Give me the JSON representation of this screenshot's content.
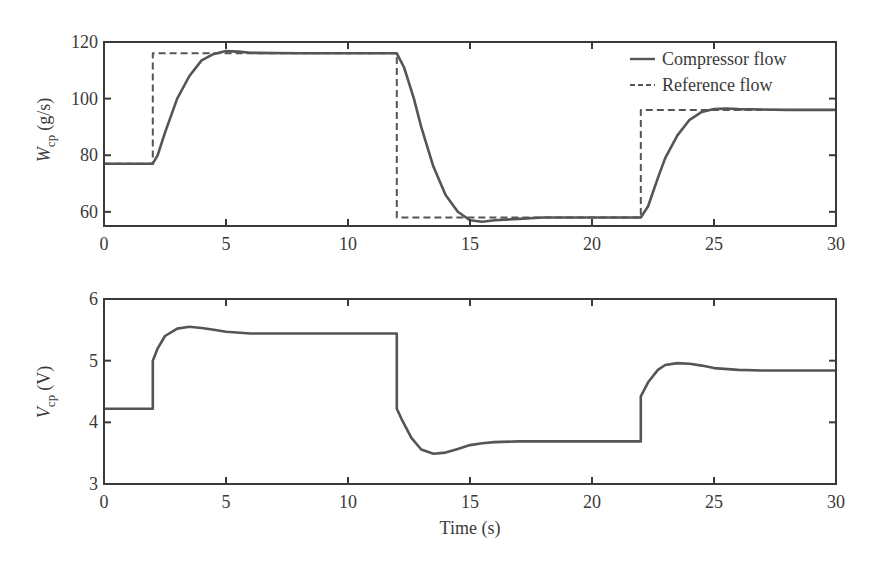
{
  "chart_data": [
    {
      "type": "line",
      "title": "",
      "xlabel": "",
      "ylabel": "W_cp (g/s)",
      "ylabel_main": "W",
      "ylabel_sub": "cp",
      "ylabel_unit": "(g/s)",
      "xlim": [
        0,
        30
      ],
      "ylim": [
        55,
        120
      ],
      "xticks": [
        0,
        5,
        10,
        15,
        20,
        25,
        30
      ],
      "xtick_labels": [
        "0",
        "5",
        "10",
        "15",
        "20",
        "25",
        "30"
      ],
      "yticks": [
        60,
        80,
        100,
        120
      ],
      "ytick_labels": [
        "60",
        "80",
        "100",
        "120"
      ],
      "grid": false,
      "legend_position": "upper right",
      "series": [
        {
          "name": "Compressor flow",
          "style": "solid",
          "x": [
            0,
            2,
            2.2,
            2.5,
            3,
            3.5,
            4,
            4.5,
            5,
            5.5,
            6,
            8,
            10,
            12,
            12.3,
            12.7,
            13,
            13.5,
            14,
            14.5,
            15,
            15.5,
            16,
            17,
            18,
            20,
            22,
            22.3,
            22.7,
            23,
            23.5,
            24,
            24.5,
            25,
            25.5,
            26,
            28,
            30
          ],
          "y": [
            77,
            77,
            80,
            88,
            100,
            108,
            113.5,
            115.8,
            116.8,
            116.6,
            116.2,
            116,
            116,
            116,
            111,
            100,
            90,
            76,
            66,
            60,
            57,
            56.5,
            57,
            57.5,
            58,
            58,
            58,
            62,
            72,
            79,
            87,
            92.5,
            95.3,
            96.3,
            96.5,
            96.3,
            96,
            96
          ]
        },
        {
          "name": "Reference flow",
          "style": "dashed",
          "x": [
            0,
            2,
            2,
            12,
            12,
            22,
            22,
            30
          ],
          "y": [
            77,
            77,
            116,
            116,
            58,
            58,
            96,
            96
          ]
        }
      ]
    },
    {
      "type": "line",
      "title": "",
      "xlabel": "Time (s)",
      "ylabel": "V_cp (V)",
      "ylabel_main": "V",
      "ylabel_sub": "cp",
      "ylabel_unit": "(V)",
      "xlim": [
        0,
        30
      ],
      "ylim": [
        3,
        6
      ],
      "xticks": [
        0,
        5,
        10,
        15,
        20,
        25,
        30
      ],
      "xtick_labels": [
        "0",
        "5",
        "10",
        "15",
        "20",
        "25",
        "30"
      ],
      "yticks": [
        3,
        4,
        5,
        6
      ],
      "ytick_labels": [
        "3",
        "4",
        "5",
        "6"
      ],
      "grid": false,
      "series": [
        {
          "name": "Compressor voltage",
          "style": "solid",
          "x": [
            0,
            2,
            2,
            2.2,
            2.5,
            3,
            3.5,
            4,
            4.5,
            5,
            6,
            8,
            10,
            12,
            12,
            12.2,
            12.6,
            13,
            13.5,
            14,
            14.5,
            15,
            15.5,
            16,
            17,
            18,
            20,
            22,
            22,
            22.3,
            22.7,
            23,
            23.5,
            24,
            24.5,
            25,
            26,
            27,
            28,
            30
          ],
          "y": [
            4.22,
            4.22,
            5.0,
            5.2,
            5.4,
            5.52,
            5.55,
            5.53,
            5.5,
            5.47,
            5.44,
            5.44,
            5.44,
            5.44,
            4.22,
            4.05,
            3.75,
            3.56,
            3.49,
            3.51,
            3.57,
            3.63,
            3.66,
            3.68,
            3.69,
            3.69,
            3.69,
            3.69,
            4.42,
            4.65,
            4.85,
            4.93,
            4.96,
            4.95,
            4.92,
            4.88,
            4.85,
            4.84,
            4.84,
            4.84
          ]
        }
      ]
    }
  ],
  "legend": {
    "items": [
      {
        "label": "Compressor flow",
        "style": "solid"
      },
      {
        "label": "Reference flow",
        "style": "dashed"
      }
    ]
  },
  "colors": {
    "line": "#555555",
    "axis": "#3a3a3a",
    "background": "#ffffff"
  }
}
